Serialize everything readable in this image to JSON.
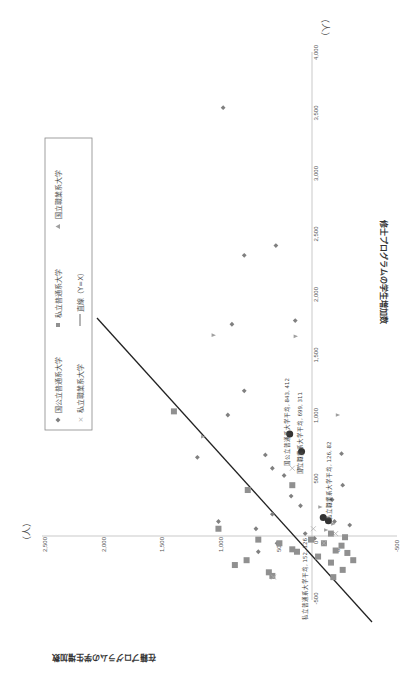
{
  "chart_data": {
    "type": "scatter",
    "orientation_note": "chart is rendered rotated 90 degrees clockwise",
    "title": "",
    "xlabel": "修士プログラムの学生増加数",
    "ylabel": "在籍プログラムの学生増加数",
    "x_unit": "（人）",
    "y_unit": "（人）",
    "xlim": [
      -500,
      4000
    ],
    "ylim": [
      -500,
      2500
    ],
    "x_ticks": [
      "-500",
      "0",
      "500",
      "1,000",
      "1,500",
      "2,000",
      "2,500",
      "3,000",
      "3,500",
      "4,000"
    ],
    "y_ticks": [
      "-500",
      "0",
      "500",
      "1,000",
      "1,500",
      "2,000",
      "2,500"
    ],
    "grid": false,
    "legend_position": "upper-left (rotated)",
    "legend": [
      {
        "marker": "diamond",
        "label": "国公立普通系大学"
      },
      {
        "marker": "square",
        "label": "私立普通系大学"
      },
      {
        "marker": "triangle",
        "label": "国立職業系大学"
      },
      {
        "marker": "x",
        "label": "私立職業系大学"
      },
      {
        "marker": "line",
        "label": "直線（Y=X）"
      }
    ],
    "series": [
      {
        "name": "国公立普通系大学",
        "marker": "diamond",
        "color": "#808080",
        "points": [
          [
            3540,
            980
          ],
          [
            2320,
            800
          ],
          [
            2400,
            530
          ],
          [
            1750,
            905
          ],
          [
            1780,
            365
          ],
          [
            1200,
            800
          ],
          [
            1000,
            940
          ],
          [
            650,
            1200
          ],
          [
            670,
            620
          ],
          [
            560,
            560
          ],
          [
            500,
            460
          ],
          [
            330,
            400
          ],
          [
            250,
            320
          ],
          [
            180,
            560
          ],
          [
            120,
            1020
          ],
          [
            60,
            700
          ],
          [
            20,
            280
          ],
          [
            -60,
            520
          ],
          [
            -130,
            680
          ],
          [
            -20,
            200
          ],
          [
            120,
            30
          ],
          [
            300,
            50
          ],
          [
            680,
            -30
          ],
          [
            420,
            -40
          ],
          [
            90,
            -100
          ]
        ]
      },
      {
        "name": "私立普通系大学",
        "marker": "square",
        "color": "#909090",
        "points": [
          [
            1030,
            1400
          ],
          [
            60,
            1020
          ],
          [
            380,
            770
          ],
          [
            420,
            390
          ],
          [
            -30,
            680
          ],
          [
            -60,
            500
          ],
          [
            -110,
            390
          ],
          [
            -130,
            350
          ],
          [
            -30,
            230
          ],
          [
            -200,
            780
          ],
          [
            -240,
            880
          ],
          [
            -300,
            590
          ],
          [
            -330,
            560
          ],
          [
            -170,
            170
          ],
          [
            -220,
            60
          ],
          [
            -120,
            20
          ],
          [
            -80,
            -30
          ],
          [
            -140,
            -80
          ],
          [
            -280,
            -40
          ],
          [
            -340,
            40
          ],
          [
            -60,
            120
          ],
          [
            20,
            60
          ],
          [
            -10,
            -60
          ],
          [
            -200,
            -130
          ]
        ]
      },
      {
        "name": "国立職業系大学",
        "marker": "triangle",
        "color": "#a0a0a0",
        "points": [
          [
            1660,
            1060
          ],
          [
            1650,
            360
          ],
          [
            820,
            1150
          ],
          [
            1000,
            0
          ],
          [
            560,
            330
          ],
          [
            240,
            150
          ],
          [
            100,
            40
          ],
          [
            50,
            100
          ]
        ]
      },
      {
        "name": "私立職業系大学",
        "marker": "x",
        "color": "#b0b0b0",
        "points": [
          [
            -340,
            550
          ],
          [
            560,
            390
          ],
          [
            60,
            210
          ],
          [
            -60,
            120
          ],
          [
            20,
            20
          ]
        ]
      },
      {
        "name": "平均",
        "marker": "circle-large",
        "color": "#333333",
        "points": [
          [
            843,
            412
          ],
          [
            699,
            311
          ],
          [
            126,
            82
          ],
          [
            152,
            126
          ]
        ]
      }
    ],
    "reference_line": {
      "label": "直線（Y=X）",
      "from": [
        -500,
        -500
      ],
      "to": [
        2000,
        2000
      ]
    },
    "annotations": [
      {
        "text": "国公立普通系大学平均, 843, 412",
        "x": 843,
        "y": 412
      },
      {
        "text": "国立職業系大学平均, 699, 311",
        "x": 699,
        "y": 311
      },
      {
        "text": "私立職業系大学平均, 126, 82",
        "x": 126,
        "y": 82
      },
      {
        "text": "私立普通系大学平均, 152, 126",
        "x": 152,
        "y": 126
      }
    ]
  },
  "labels": {
    "x_unit": "（人）",
    "y_unit": "（人）",
    "x_title": "修士プログラムの学生増加数",
    "y_title": "在籍プログラムの学生増加数",
    "legend": {
      "item1": "国公立普通系大学",
      "item2": "私立普通系大学",
      "item3": "国立職業系大学",
      "item4": "私立職業系大学",
      "item5": "直線（Y=X）"
    },
    "annotations": {
      "a1": "国公立普通系大学平均, 843, 412",
      "a2": "国立職業系大学平均, 699, 311",
      "a3": "私立職業系大学平均, 126, 82",
      "a4": "私立普通系大学平均, 152, 126"
    }
  }
}
